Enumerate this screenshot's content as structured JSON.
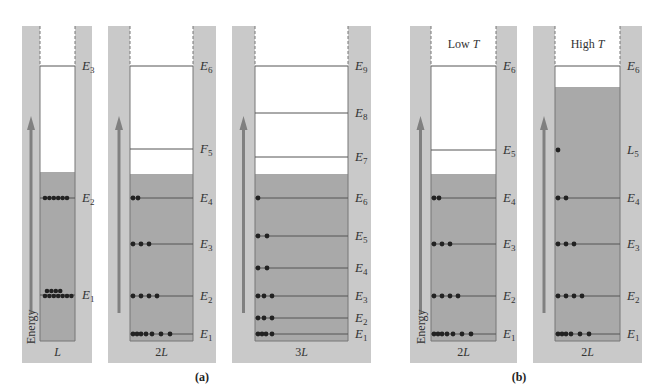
{
  "colors": {
    "wall": "#c9c9c9",
    "fill": "#a9a9a9",
    "line": "#555555",
    "dot": "#222222",
    "arrow": "#808080"
  },
  "panels": [
    {
      "id": "L",
      "outer": [
        22,
        26,
        92,
        363
      ],
      "inner": [
        40,
        75
      ],
      "bottom": 341,
      "fill_top": 172,
      "width_label": "L",
      "top_label": "",
      "energy_label": "Energy",
      "levels": [
        {
          "label": "E",
          "sub": "3",
          "y": 66,
          "dots": 0
        },
        {
          "label": "E",
          "sub": "2",
          "y": 198,
          "dots": 6
        },
        {
          "label": "E",
          "sub": "1",
          "y": 295,
          "dots": 11
        }
      ]
    },
    {
      "id": "2L-a",
      "outer": [
        108,
        26,
        216,
        363
      ],
      "inner": [
        130,
        193
      ],
      "bottom": 341,
      "fill_top": 174,
      "width_label": "2L",
      "top_label": "",
      "energy_label": "",
      "levels": [
        {
          "label": "E",
          "sub": "6",
          "y": 66,
          "dots": 0
        },
        {
          "label": "F",
          "sub": "5",
          "y": 149,
          "dots": 0
        },
        {
          "label": "E",
          "sub": "4",
          "y": 198,
          "dots": 2
        },
        {
          "label": "E",
          "sub": "3",
          "y": 244,
          "dots": 3
        },
        {
          "label": "E",
          "sub": "2",
          "y": 296,
          "dots": 4
        },
        {
          "label": "E",
          "sub": "1",
          "y": 334,
          "dots": 7
        }
      ]
    },
    {
      "id": "3L",
      "outer": [
        232,
        26,
        371,
        363
      ],
      "inner": [
        255,
        348
      ],
      "bottom": 341,
      "fill_top": 174,
      "width_label": "3L",
      "top_label": "",
      "energy_label": "",
      "levels": [
        {
          "label": "E",
          "sub": "9",
          "y": 66,
          "dots": 0
        },
        {
          "label": "E",
          "sub": "8",
          "y": 113,
          "dots": 0
        },
        {
          "label": "E",
          "sub": "7",
          "y": 157,
          "dots": 0
        },
        {
          "label": "E",
          "sub": "6",
          "y": 198,
          "dots": 1
        },
        {
          "label": "E",
          "sub": "5",
          "y": 236,
          "dots": 2
        },
        {
          "label": "E",
          "sub": "4",
          "y": 268,
          "dots": 2
        },
        {
          "label": "E",
          "sub": "3",
          "y": 296,
          "dots": 3
        },
        {
          "label": "E",
          "sub": "2",
          "y": 318,
          "dots": 3
        },
        {
          "label": "E",
          "sub": "1",
          "y": 334,
          "dots": 4
        }
      ]
    },
    {
      "id": "2L-lowT",
      "outer": [
        410,
        26,
        517,
        363
      ],
      "inner": [
        431,
        496
      ],
      "bottom": 341,
      "fill_top": 174,
      "width_label": "2L",
      "top_label": "Low T",
      "energy_label": "Energy",
      "levels": [
        {
          "label": "E",
          "sub": "6",
          "y": 66,
          "dots": 0
        },
        {
          "label": "E",
          "sub": "5",
          "y": 150,
          "dots": 0
        },
        {
          "label": "E",
          "sub": "4",
          "y": 198,
          "dots": 2
        },
        {
          "label": "E",
          "sub": "3",
          "y": 244,
          "dots": 3
        },
        {
          "label": "E",
          "sub": "2",
          "y": 296,
          "dots": 4
        },
        {
          "label": "E",
          "sub": "1",
          "y": 334,
          "dots": 7
        }
      ]
    },
    {
      "id": "2L-highT",
      "outer": [
        533,
        26,
        642,
        363
      ],
      "inner": [
        555,
        620
      ],
      "bottom": 341,
      "fill_top": 87,
      "width_label": "2L",
      "top_label": "High T",
      "energy_label": "",
      "levels": [
        {
          "label": "E",
          "sub": "6",
          "y": 66,
          "dots": 0
        },
        {
          "label": "L",
          "sub": "5",
          "y": 150,
          "dots": 1,
          "faint_line": true
        },
        {
          "label": "E",
          "sub": "4",
          "y": 198,
          "dots": 2
        },
        {
          "label": "E",
          "sub": "3",
          "y": 244,
          "dots": 3
        },
        {
          "label": "E",
          "sub": "2",
          "y": 296,
          "dots": 4
        },
        {
          "label": "E",
          "sub": "1",
          "y": 334,
          "dots": 6
        }
      ]
    }
  ],
  "part_labels": [
    {
      "text": "(a)",
      "x": 202,
      "y": 381
    },
    {
      "text": "(b)",
      "x": 519,
      "y": 381
    }
  ]
}
